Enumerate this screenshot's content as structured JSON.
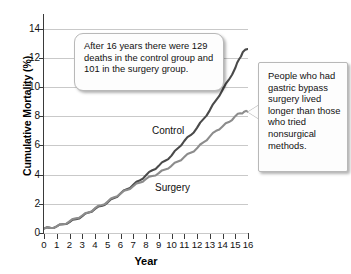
{
  "chart_data": {
    "type": "line",
    "title": "",
    "xlabel": "Year",
    "ylabel": "Cumulative Mortality (%)",
    "xlim": [
      0,
      16
    ],
    "ylim": [
      0,
      15
    ],
    "xticks": [
      0,
      1,
      2,
      3,
      4,
      5,
      6,
      7,
      8,
      9,
      10,
      11,
      12,
      13,
      14,
      15,
      16
    ],
    "yticks": [
      0,
      2,
      4,
      6,
      8,
      10,
      12,
      14
    ],
    "grid": "horizontal",
    "legend": "inline-labels",
    "series": [
      {
        "name": "Control",
        "color": "#4a4a4a",
        "x": [
          0,
          0.5,
          1,
          1.5,
          2,
          2.5,
          3,
          3.5,
          4,
          4.5,
          5,
          5.5,
          6,
          6.5,
          7,
          7.5,
          8,
          8.5,
          9,
          9.5,
          10,
          10.5,
          11,
          11.5,
          12,
          12.5,
          13,
          13.5,
          14,
          14.5,
          15,
          15.3,
          15.6,
          16
        ],
        "values": [
          0.3,
          0.35,
          0.45,
          0.6,
          0.75,
          0.95,
          1.15,
          1.4,
          1.65,
          1.85,
          2.1,
          2.4,
          2.7,
          3.0,
          3.3,
          3.6,
          3.95,
          4.3,
          4.6,
          4.95,
          5.3,
          5.8,
          6.3,
          6.7,
          7.2,
          7.8,
          8.4,
          9.1,
          9.8,
          10.5,
          11.3,
          11.9,
          12.4,
          12.6
        ]
      },
      {
        "name": "Surgery",
        "color": "#8c8c8c",
        "x": [
          0,
          0.5,
          1,
          1.5,
          2,
          2.5,
          3,
          3.5,
          4,
          4.5,
          5,
          5.5,
          6,
          6.5,
          7,
          7.5,
          8,
          8.5,
          9,
          9.5,
          10,
          10.5,
          11,
          11.5,
          12,
          12.5,
          13,
          13.5,
          14,
          14.5,
          15,
          15.4,
          15.7,
          16
        ],
        "values": [
          0.3,
          0.35,
          0.45,
          0.6,
          0.8,
          1.0,
          1.2,
          1.4,
          1.7,
          1.9,
          2.15,
          2.45,
          2.7,
          2.95,
          3.2,
          3.45,
          3.7,
          3.9,
          4.1,
          4.35,
          4.6,
          4.9,
          5.2,
          5.5,
          5.8,
          6.2,
          6.6,
          7.0,
          7.3,
          7.6,
          8.0,
          8.2,
          8.3,
          8.3
        ]
      }
    ],
    "series_labels": [
      {
        "text": "Control"
      },
      {
        "text": "Surgery"
      }
    ]
  },
  "annotations": {
    "deaths_note": "After 16 years there were 129 deaths in the control group and 101 in the surgery group.",
    "survival_note": "People who had gastric bypass surgery lived longer than those who tried nonsurgical methods."
  }
}
